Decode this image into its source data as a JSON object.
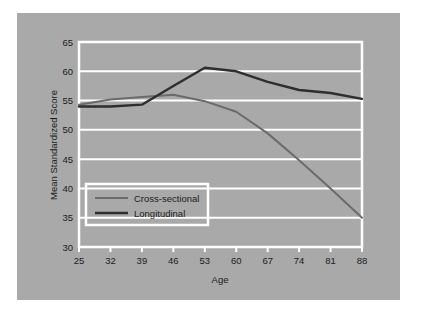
{
  "figure": {
    "background_color": "#ffffff",
    "panel_color": "#a9a9a9",
    "plot_area_color": "#a9a9a9",
    "gridline_color": "#ffffff",
    "axis_border_color": "#ffffff"
  },
  "chart_data": {
    "type": "line",
    "title": "",
    "subtitle": "",
    "xlabel": "Age",
    "ylabel": "Mean Standardized Score",
    "x": [
      25,
      32,
      39,
      46,
      53,
      60,
      67,
      74,
      81,
      88
    ],
    "categories": [
      "25",
      "32",
      "39",
      "46",
      "53",
      "60",
      "67",
      "74",
      "81",
      "88"
    ],
    "xlim": [
      25,
      88
    ],
    "ylim": [
      30,
      65
    ],
    "xticks": [
      25,
      32,
      39,
      46,
      53,
      60,
      67,
      74,
      81,
      88
    ],
    "yticks": [
      30,
      35,
      40,
      45,
      50,
      55,
      60,
      65
    ],
    "xtick_labels": [
      "25",
      "32",
      "39",
      "46",
      "53",
      "60",
      "67",
      "74",
      "81",
      "88"
    ],
    "ytick_labels": [
      "30",
      "35",
      "40",
      "45",
      "50",
      "55",
      "60",
      "65"
    ],
    "grid": "horizontal",
    "legend_position": "lower-left-inside",
    "series": [
      {
        "name": "Cross-sectional",
        "color": "#6b6b6b",
        "line_width": 2.0,
        "values": [
          54.3,
          55.2,
          55.6,
          56.0,
          54.9,
          53.1,
          49.4,
          44.8,
          40.0,
          35.0
        ]
      },
      {
        "name": "Longitudinal",
        "color": "#2e2e2e",
        "line_width": 2.4,
        "values": [
          54.0,
          54.0,
          54.3,
          57.5,
          60.6,
          60.0,
          58.2,
          56.8,
          56.3,
          55.3
        ]
      }
    ]
  },
  "legend": {
    "entries": [
      {
        "label": "Cross-sectional",
        "color": "#6b6b6b"
      },
      {
        "label": "Longitudinal",
        "color": "#2e2e2e"
      }
    ]
  }
}
